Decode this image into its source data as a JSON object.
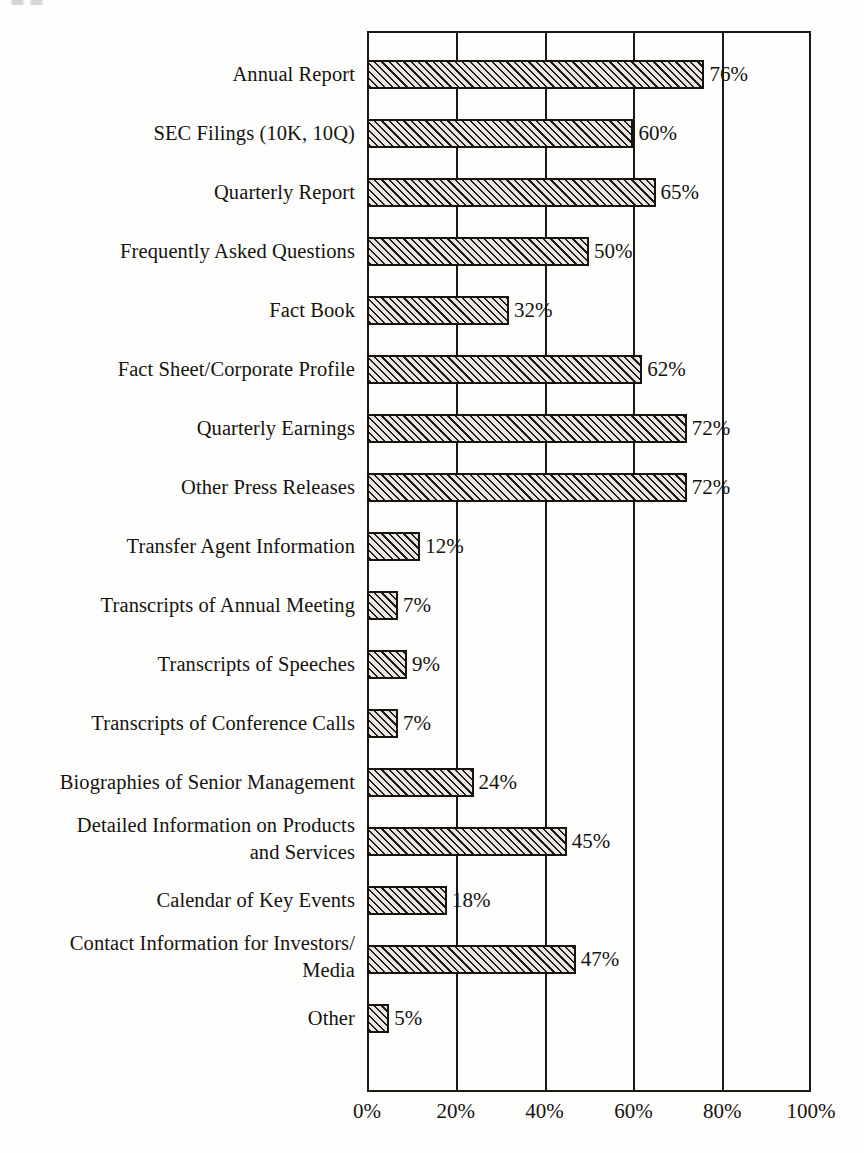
{
  "chart_data": {
    "type": "bar",
    "orientation": "horizontal",
    "title": "",
    "subtitle": "",
    "xlabel": "",
    "ylabel": "",
    "xlim": [
      0,
      100
    ],
    "xticks": [
      "0%",
      "20%",
      "40%",
      "60%",
      "80%",
      "100%"
    ],
    "xtick_values": [
      0,
      20,
      40,
      60,
      80,
      100
    ],
    "grid": "vertical gridlines at every 20%",
    "legend": "none",
    "value_label_suffix": "%",
    "categories": [
      "Annual Report",
      "SEC Filings (10K, 10Q)",
      "Quarterly Report",
      "Frequently Asked Questions",
      "Fact Book",
      "Fact Sheet/Corporate Profile",
      "Quarterly Earnings",
      "Other Press Releases",
      "Transfer Agent Information",
      "Transcripts of Annual Meeting",
      "Transcripts of Speeches",
      "Transcripts of Conference Calls",
      "Biographies of Senior Management",
      "Detailed Information on Products\nand Services",
      "Calendar of Key Events",
      "Contact Information for Investors/\nMedia",
      "Other"
    ],
    "values": [
      76,
      60,
      65,
      50,
      32,
      62,
      72,
      72,
      12,
      7,
      9,
      7,
      24,
      45,
      18,
      47,
      5
    ],
    "value_labels": [
      "76%",
      "60%",
      "65%",
      "50%",
      "32%",
      "62%",
      "72%",
      "72%",
      "12%",
      "7%",
      "9%",
      "7%",
      "24%",
      "45%",
      "18%",
      "47%",
      "5%"
    ]
  },
  "style": {
    "bar_fill": "#e9e7e3",
    "bar_hatch": "#201b17",
    "bar_edge": "#17120f",
    "axis_color": "#1b1714",
    "text_color": "#16130f",
    "background": "#fdfdfc"
  }
}
